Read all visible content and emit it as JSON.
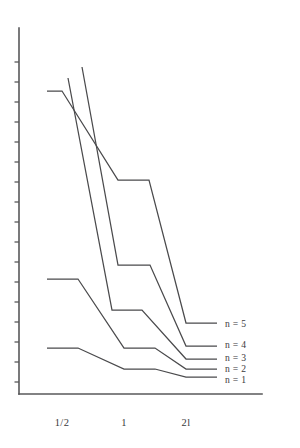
{
  "figure": {
    "background_color": "#ffffff",
    "ink_color": "#4a4a4c",
    "axis_color": "#58585a"
  },
  "chart_data": {
    "type": "line",
    "title": "",
    "subtitle": "",
    "xlabel": "",
    "ylabel": "",
    "grid": false,
    "legend_position": "right-inline",
    "x_tick_labels": [
      "1/2",
      "1",
      "2l"
    ],
    "x_tick_positions_px": [
      62,
      124,
      186
    ],
    "y_tick_count": 17,
    "y_axis_scale": "log",
    "axis_ranges": {
      "x_axis_px": [
        19,
        262
      ],
      "y_axis_px": [
        28,
        394
      ]
    },
    "annotations": [
      "Decay curves for n = 1 through n = 5",
      "Each curve is a piecewise-linear staircase with flat plateaus centred on the x tick positions"
    ],
    "series": [
      {
        "name": "n = 1",
        "label": "n = 1",
        "legend_y_px": 380,
        "points_px": [
          [
            47,
            348
          ],
          [
            78,
            348
          ],
          [
            124,
            369
          ],
          [
            155,
            369
          ],
          [
            186,
            377
          ],
          [
            217,
            377
          ]
        ]
      },
      {
        "name": "n = 2",
        "label": "n = 2",
        "legend_y_px": 369,
        "points_px": [
          [
            47,
            279
          ],
          [
            78,
            279
          ],
          [
            124,
            348
          ],
          [
            155,
            348
          ],
          [
            186,
            369
          ],
          [
            217,
            369
          ]
        ]
      },
      {
        "name": "n = 3",
        "label": "n = 3",
        "legend_y_px": 358,
        "points_px": [
          [
            68,
            78
          ],
          [
            112,
            310
          ],
          [
            142,
            310
          ],
          [
            186,
            359
          ],
          [
            217,
            359
          ]
        ]
      },
      {
        "name": "n = 4",
        "label": "n = 4",
        "legend_y_px": 345,
        "points_px": [
          [
            82,
            67
          ],
          [
            118,
            265
          ],
          [
            150,
            265
          ],
          [
            186,
            346
          ],
          [
            217,
            346
          ]
        ]
      },
      {
        "name": "n = 5",
        "label": "n = 5",
        "legend_y_px": 324,
        "points_px": [
          [
            47,
            91
          ],
          [
            62,
            91
          ],
          [
            118,
            180
          ],
          [
            149,
            180
          ],
          [
            186,
            323
          ],
          [
            217,
            323
          ]
        ]
      }
    ],
    "y_ticks_px": [
      62,
      82,
      102,
      122,
      142,
      162,
      182,
      202,
      222,
      242,
      262,
      282,
      302,
      322,
      342,
      362,
      382
    ]
  }
}
